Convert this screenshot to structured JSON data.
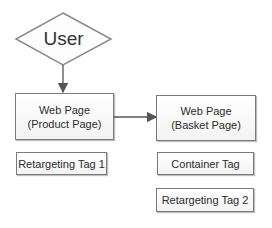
{
  "diagram": {
    "start_node": {
      "label": "User",
      "shape": "diamond"
    },
    "nodes": [
      {
        "id": "product",
        "line1": "Web Page",
        "line2": "(Product Page)"
      },
      {
        "id": "basket",
        "line1": "Web Page",
        "line2": "(Basket Page)"
      }
    ],
    "tags": [
      {
        "id": "tag1",
        "label": "Retargeting Tag 1",
        "under": "product"
      },
      {
        "id": "container",
        "label": "Container Tag",
        "under": "basket"
      },
      {
        "id": "tag2",
        "label": "Retargeting Tag 2",
        "under": "basket"
      }
    ],
    "edges": [
      {
        "from": "User",
        "to": "product"
      },
      {
        "from": "product",
        "to": "basket"
      }
    ],
    "colors": {
      "border": "#7a7a7a",
      "arrow": "#555555",
      "text": "#2b2b2b"
    }
  }
}
